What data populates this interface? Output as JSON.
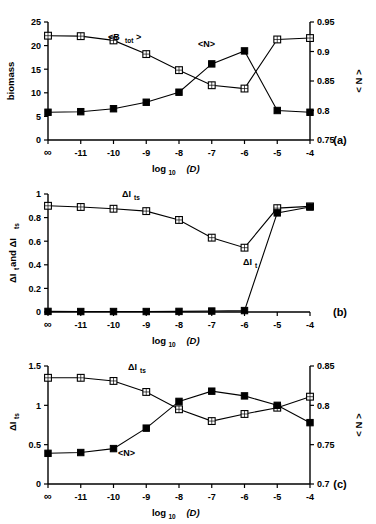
{
  "figure": {
    "xlabel": "log",
    "xlabel_sub": "10",
    "xlabel_var": "(D)",
    "categories": [
      "∞",
      "-11",
      "-10",
      "-9",
      "-8",
      "-7",
      "-6",
      "-5",
      "-4"
    ]
  },
  "panels": [
    {
      "tag": "(a)",
      "ylabel_left": "biomass",
      "ylabel_right": "< N >",
      "yticks_left": [
        "0",
        "5",
        "10",
        "15",
        "20",
        "25"
      ],
      "yticks_right": [
        "0.75",
        "0.8",
        "0.85",
        "0.9",
        "0.95"
      ],
      "label_btot": "<B",
      "label_btot_sub": "tot",
      "label_btot_end": ">",
      "label_n": "<N>"
    },
    {
      "tag": "(b)",
      "ylabel_left": "ΔI",
      "ylabel_left_sub1": "t",
      "ylabel_left_mid": " and ΔI",
      "ylabel_left_sub2": "ts",
      "yticks_left": [
        "0",
        "0.2",
        "0.4",
        "0.6",
        "0.8",
        "1"
      ],
      "label_its": "ΔI",
      "label_its_sub": "ts",
      "label_it": "ΔI",
      "label_it_sub": "t"
    },
    {
      "tag": "(c)",
      "ylabel_left": "ΔI",
      "ylabel_left_sub": "ts",
      "ylabel_right": "< N >",
      "yticks_left": [
        "0",
        "0.5",
        "1",
        "1.5"
      ],
      "yticks_right": [
        "0.7",
        "0.75",
        "0.8",
        "0.85"
      ],
      "label_its": "ΔI",
      "label_its_sub": "ts",
      "label_n": "<N>"
    }
  ],
  "chart_data": [
    {
      "type": "line",
      "title": "",
      "panel": "(a)",
      "xlabel": "log10 (D)",
      "ylabel": "biomass",
      "ylabel_secondary": "< N >",
      "x": [
        "∞",
        "-11",
        "-10",
        "-9",
        "-8",
        "-7",
        "-6",
        "-5",
        "-4"
      ],
      "ylim": [
        0,
        25
      ],
      "ylim_secondary": [
        0.75,
        0.95
      ],
      "grid": false,
      "legend": "inline-annotations",
      "series": [
        {
          "name": "<B_tot>",
          "axis": "left",
          "marker": "open-square",
          "values": [
            22.1,
            22.0,
            21.1,
            18.2,
            14.8,
            11.6,
            10.9,
            21.3,
            21.6
          ]
        },
        {
          "name": "<N>",
          "axis": "right",
          "marker": "filled-square",
          "values": [
            0.797,
            0.798,
            0.803,
            0.814,
            0.831,
            0.879,
            0.901,
            0.8,
            0.797
          ]
        }
      ]
    },
    {
      "type": "line",
      "title": "",
      "panel": "(b)",
      "xlabel": "log10 (D)",
      "ylabel": "ΔI_t and ΔI_ts",
      "x": [
        "∞",
        "-11",
        "-10",
        "-9",
        "-8",
        "-7",
        "-6",
        "-5",
        "-4"
      ],
      "ylim": [
        0,
        1
      ],
      "grid": false,
      "legend": "inline-annotations",
      "series": [
        {
          "name": "ΔI_ts",
          "axis": "left",
          "marker": "open-square",
          "values": [
            0.9,
            0.89,
            0.875,
            0.855,
            0.78,
            0.63,
            0.545,
            0.88,
            0.895
          ]
        },
        {
          "name": "ΔI_t",
          "axis": "left",
          "marker": "filled-square",
          "values": [
            0.005,
            0.004,
            0.004,
            0.004,
            0.005,
            0.008,
            0.012,
            0.84,
            0.89
          ]
        }
      ]
    },
    {
      "type": "line",
      "title": "",
      "panel": "(c)",
      "xlabel": "log10 (D)",
      "ylabel": "ΔI_ts",
      "ylabel_secondary": "< N >",
      "x": [
        "∞",
        "-11",
        "-10",
        "-9",
        "-8",
        "-7",
        "-6",
        "-5",
        "-4"
      ],
      "ylim": [
        0,
        1.5
      ],
      "ylim_secondary": [
        0.7,
        0.85
      ],
      "grid": false,
      "legend": "inline-annotations",
      "series": [
        {
          "name": "ΔI_ts",
          "axis": "left",
          "marker": "open-square",
          "values": [
            1.35,
            1.35,
            1.31,
            1.17,
            0.95,
            0.8,
            0.89,
            0.97,
            1.11
          ]
        },
        {
          "name": "<N>",
          "axis": "right",
          "marker": "filled-square",
          "values": [
            0.739,
            0.74,
            0.745,
            0.771,
            0.805,
            0.818,
            0.812,
            0.8,
            0.778
          ]
        }
      ]
    }
  ]
}
